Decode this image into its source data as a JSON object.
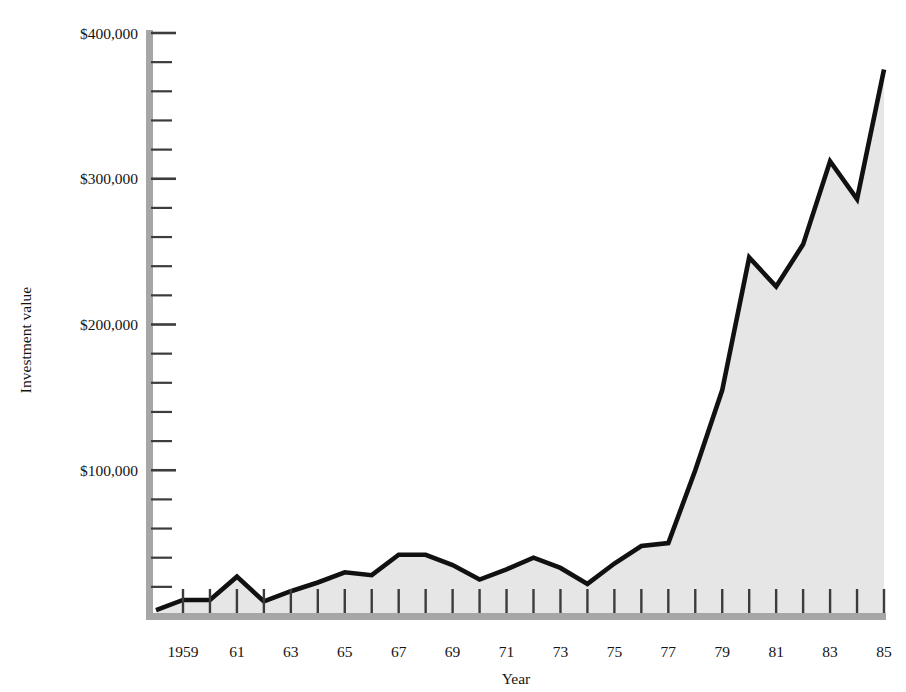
{
  "chart_data": {
    "type": "area",
    "title": "",
    "xlabel": "Year",
    "ylabel": "Investment value",
    "xlim": [
      1958,
      1985
    ],
    "ylim": [
      0,
      400000
    ],
    "grid": false,
    "legend": "none",
    "y_major_interval": 100000,
    "y_minor_interval": 20000,
    "x_label_interval": 2,
    "x_tick_interval": 1,
    "y_tick_labels": [
      "$100,000",
      "$200,000",
      "$300,000",
      "$400,000"
    ],
    "y_tick_values": [
      100000,
      200000,
      300000,
      400000
    ],
    "x_tick_labels": [
      "1959",
      "61",
      "63",
      "65",
      "67",
      "69",
      "71",
      "73",
      "75",
      "77",
      "79",
      "81",
      "83",
      "85"
    ],
    "x_tick_values": [
      1959,
      1961,
      1963,
      1965,
      1967,
      1969,
      1971,
      1973,
      1975,
      1977,
      1979,
      1981,
      1983,
      1985
    ],
    "x": [
      1958,
      1959,
      1960,
      1961,
      1962,
      1963,
      1964,
      1965,
      1966,
      1967,
      1968,
      1969,
      1970,
      1971,
      1972,
      1973,
      1974,
      1975,
      1976,
      1977,
      1978,
      1979,
      1980,
      1981,
      1982,
      1983,
      1984,
      1985
    ],
    "values": [
      4000,
      11000,
      11000,
      27000,
      10000,
      17000,
      23000,
      30000,
      28000,
      42000,
      42000,
      35000,
      25000,
      32000,
      40000,
      33000,
      22000,
      36000,
      48000,
      50000,
      100000,
      155000,
      246000,
      226000,
      255000,
      312000,
      286000,
      375000
    ],
    "series": [
      {
        "name": "Investment value",
        "values": [
          4000,
          11000,
          11000,
          27000,
          10000,
          17000,
          23000,
          30000,
          28000,
          42000,
          42000,
          35000,
          25000,
          32000,
          40000,
          33000,
          22000,
          36000,
          48000,
          50000,
          100000,
          155000,
          246000,
          226000,
          255000,
          312000,
          286000,
          375000
        ]
      }
    ],
    "colors": {
      "line": "#111111",
      "fill": "#e6e6e6",
      "axis": "#9b9b9b",
      "tick": "#4a4a4a",
      "text": "#141414",
      "background": "#ffffff"
    }
  }
}
